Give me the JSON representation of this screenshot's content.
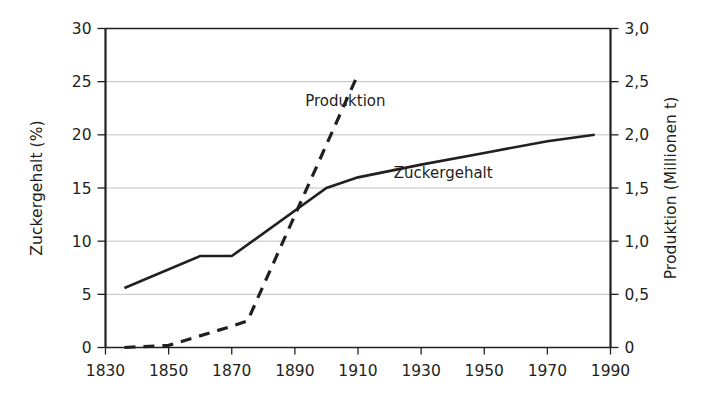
{
  "chart_data": {
    "type": "line",
    "title": "",
    "xlabel": "",
    "ylabel": "Zuckergehalt (%)",
    "y2label": "Produktion (Millionen t)",
    "xlim": [
      1830,
      1990
    ],
    "ylim": [
      0,
      30
    ],
    "y2lim": [
      0,
      3.0
    ],
    "grid": true,
    "legend_position": "inline-annotations",
    "x_ticks": [
      "1830",
      "1850",
      "1870",
      "1890",
      "1910",
      "1930",
      "1950",
      "1970",
      "1990"
    ],
    "x_tick_values": [
      1830,
      1850,
      1870,
      1890,
      1910,
      1930,
      1950,
      1970,
      1990
    ],
    "y_ticks": [
      "0",
      "5",
      "10",
      "15",
      "20",
      "25",
      "30"
    ],
    "y_tick_values": [
      0,
      5,
      10,
      15,
      20,
      25,
      30
    ],
    "y2_ticks": [
      "0",
      "0,5",
      "1,0",
      "1,5",
      "2,0",
      "2,5",
      "3,0"
    ],
    "y2_tick_values": [
      0,
      0.5,
      1.0,
      1.5,
      2.0,
      2.5,
      3.0
    ],
    "series": [
      {
        "name": "Zuckergehalt",
        "axis": "left",
        "style": "solid",
        "color": "#231f20",
        "annotation": "Zuckergehalt",
        "annotation_x": 1937,
        "annotation_y": 16.4,
        "x": [
          1836,
          1860,
          1870,
          1900,
          1910,
          1930,
          1950,
          1970,
          1985
        ],
        "values": [
          5.6,
          8.6,
          8.6,
          15.0,
          16.0,
          17.2,
          18.3,
          19.4,
          20.0
        ]
      },
      {
        "name": "Produktion",
        "axis": "right",
        "style": "dashed",
        "color": "#231f20",
        "annotation": "Produktion",
        "annotation_x": 1906,
        "annotation_y": 2.32,
        "x": [
          1836,
          1850,
          1870,
          1875,
          1910
        ],
        "values": [
          0.0,
          0.02,
          0.2,
          0.25,
          2.57
        ]
      }
    ]
  },
  "axes": {
    "left_title": "Zuckergehalt (%)",
    "right_title": "Produktion (Millionen t)"
  }
}
